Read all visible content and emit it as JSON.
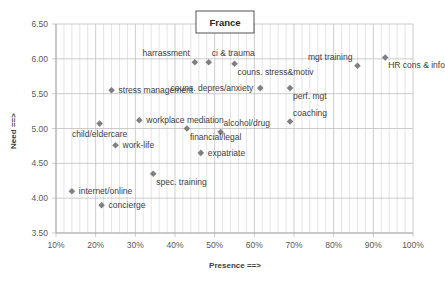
{
  "chart_data": {
    "type": "scatter",
    "title": "France",
    "xlabel": "Presence ==>",
    "ylabel": "Need ==>",
    "xlim": [
      10,
      100
    ],
    "ylim": [
      3.5,
      6.5
    ],
    "x_ticks": [
      "10%",
      "20%",
      "30%",
      "40%",
      "50%",
      "60%",
      "70%",
      "80%",
      "90%",
      "100%"
    ],
    "y_ticks": [
      "3.50",
      "4.00",
      "4.50",
      "5.00",
      "5.50",
      "6.00",
      "6.50"
    ],
    "grid": {
      "x_major": true,
      "x_minor_step": 2,
      "y_major": true
    },
    "legend": "none",
    "marker": "diamond",
    "marker_color": "#808080",
    "points": [
      {
        "label": "harrassment",
        "x": 45,
        "y": 5.95,
        "label_pos": "above-left"
      },
      {
        "label": "ci & trauma",
        "x": 48.5,
        "y": 5.95,
        "label_pos": "above-right"
      },
      {
        "label": "couns. stress&motiv",
        "x": 55,
        "y": 5.93,
        "label_pos": "below-right"
      },
      {
        "label": "mgt training",
        "x": 86,
        "y": 5.9,
        "label_pos": "above-left"
      },
      {
        "label": "HR cons & info",
        "x": 93,
        "y": 6.02,
        "label_pos": "below-right"
      },
      {
        "label": "stress management",
        "x": 24,
        "y": 5.55,
        "label_pos": "right"
      },
      {
        "label": "couns. depres/anxiety",
        "x": 61.5,
        "y": 5.58,
        "label_pos": "left"
      },
      {
        "label": "perf. mgt",
        "x": 69,
        "y": 5.58,
        "label_pos": "below-right"
      },
      {
        "label": "workplace mediation",
        "x": 31,
        "y": 5.12,
        "label_pos": "right"
      },
      {
        "label": "child/eldercare",
        "x": 21,
        "y": 5.07,
        "label_pos": "below"
      },
      {
        "label": "coaching",
        "x": 69,
        "y": 5.1,
        "label_pos": "above-right"
      },
      {
        "label": "financial/legal",
        "x": 43,
        "y": 5.0,
        "label_pos": "below-right"
      },
      {
        "label": "alcohol/drug",
        "x": 51.5,
        "y": 4.95,
        "label_pos": "above-right"
      },
      {
        "label": "work-life",
        "x": 25,
        "y": 4.76,
        "label_pos": "right"
      },
      {
        "label": "expatriate",
        "x": 46.5,
        "y": 4.65,
        "label_pos": "right"
      },
      {
        "label": "spec. training",
        "x": 34.5,
        "y": 4.35,
        "label_pos": "below-right"
      },
      {
        "label": "internet/online",
        "x": 14,
        "y": 4.1,
        "label_pos": "right"
      },
      {
        "label": "concierge",
        "x": 21.5,
        "y": 3.9,
        "label_pos": "right"
      }
    ]
  },
  "colors": {
    "background": "#ffffff",
    "grid_major": "#bfbfbf",
    "grid_minor": "#d9d9d9",
    "marker": "#808080",
    "text": "#404040",
    "tick_text": "#595959",
    "title_border": "#404040"
  }
}
